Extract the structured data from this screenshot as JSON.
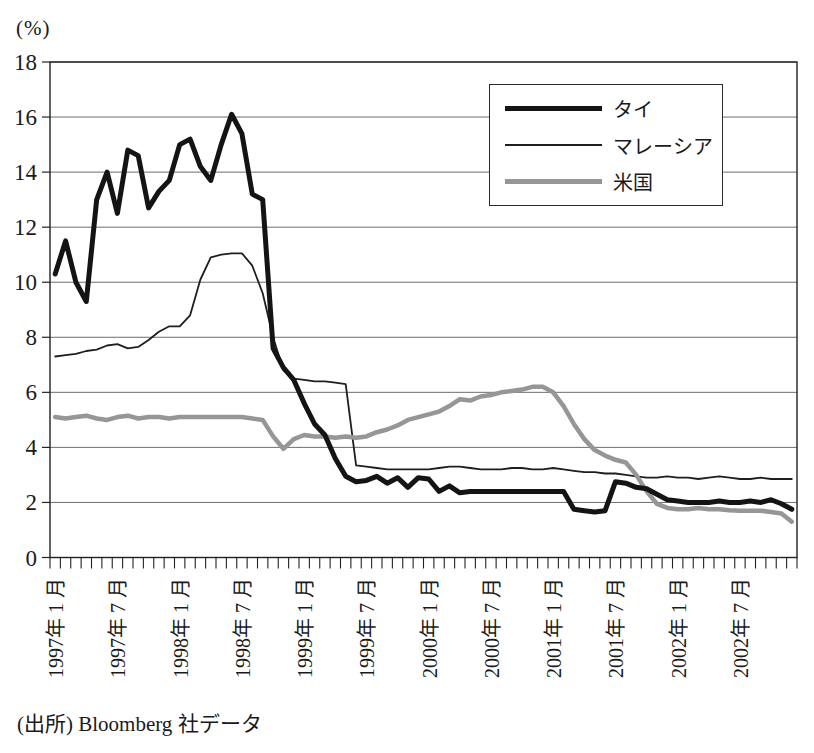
{
  "page": {
    "unit_label": "(%)",
    "source_note": "(出所) Bloomberg 社データ"
  },
  "chart_data": {
    "type": "line",
    "title": "",
    "ylabel": "(%)",
    "ylim": [
      0,
      18
    ],
    "y_ticks": [
      0,
      2,
      4,
      6,
      8,
      10,
      12,
      14,
      16,
      18
    ],
    "grid": "horizontal",
    "legend_position": "top-right",
    "x_start": "1997-01",
    "x_interval": "month",
    "x_tick_label_every_months": 6,
    "x_tick_labels": [
      "1997年 1 月",
      "1997年 7 月",
      "1998年 1 月",
      "1998年 7 月",
      "1999年 1 月",
      "1999年 7 月",
      "2000年 1 月",
      "2000年 7 月",
      "2001年 1 月",
      "2001年 7 月",
      "2002年 1 月",
      "2002年 7 月"
    ],
    "series": [
      {
        "name": "タイ",
        "color": "#141414",
        "width": 5,
        "values": [
          10.3,
          11.5,
          10.0,
          9.3,
          13.0,
          14.0,
          12.5,
          14.8,
          14.6,
          12.7,
          13.3,
          13.7,
          15.0,
          15.2,
          14.2,
          13.7,
          15.0,
          16.1,
          15.4,
          13.2,
          13.0,
          7.6,
          6.9,
          6.45,
          5.6,
          4.85,
          4.45,
          3.6,
          2.95,
          2.75,
          2.8,
          2.95,
          2.7,
          2.9,
          2.55,
          2.9,
          2.85,
          2.4,
          2.6,
          2.35,
          2.4,
          2.4,
          2.4,
          2.4,
          2.4,
          2.4,
          2.4,
          2.4,
          2.4,
          2.4,
          1.75,
          1.7,
          1.65,
          1.7,
          2.75,
          2.7,
          2.55,
          2.5,
          2.3,
          2.1,
          2.05,
          2.0,
          2.0,
          2.0,
          2.05,
          2.0,
          2.0,
          2.05,
          2.0,
          2.1,
          1.95,
          1.75
        ]
      },
      {
        "name": "マレーシア",
        "color": "#1e1e1e",
        "width": 1.8,
        "values": [
          7.3,
          7.35,
          7.4,
          7.5,
          7.55,
          7.7,
          7.75,
          7.6,
          7.65,
          7.9,
          8.2,
          8.4,
          8.4,
          8.8,
          10.1,
          10.9,
          11.0,
          11.05,
          11.05,
          10.6,
          9.6,
          8.0,
          6.8,
          6.5,
          6.45,
          6.4,
          6.4,
          6.35,
          6.3,
          3.35,
          3.3,
          3.25,
          3.2,
          3.2,
          3.2,
          3.2,
          3.2,
          3.25,
          3.3,
          3.3,
          3.25,
          3.2,
          3.2,
          3.2,
          3.25,
          3.25,
          3.2,
          3.2,
          3.25,
          3.2,
          3.15,
          3.1,
          3.1,
          3.05,
          3.05,
          3.0,
          2.95,
          2.9,
          2.9,
          2.95,
          2.9,
          2.9,
          2.85,
          2.9,
          2.95,
          2.9,
          2.85,
          2.85,
          2.9,
          2.85,
          2.85,
          2.85
        ]
      },
      {
        "name": "米国",
        "color": "#969696",
        "width": 4.5,
        "values": [
          5.1,
          5.05,
          5.1,
          5.15,
          5.05,
          5.0,
          5.1,
          5.15,
          5.05,
          5.1,
          5.1,
          5.05,
          5.1,
          5.1,
          5.1,
          5.1,
          5.1,
          5.1,
          5.1,
          5.05,
          5.0,
          4.4,
          3.95,
          4.3,
          4.45,
          4.4,
          4.4,
          4.35,
          4.4,
          4.35,
          4.4,
          4.55,
          4.65,
          4.8,
          5.0,
          5.1,
          5.2,
          5.3,
          5.5,
          5.75,
          5.7,
          5.85,
          5.9,
          6.0,
          6.05,
          6.1,
          6.2,
          6.2,
          6.0,
          5.5,
          4.85,
          4.3,
          3.9,
          3.7,
          3.55,
          3.45,
          3.0,
          2.4,
          1.95,
          1.8,
          1.75,
          1.75,
          1.8,
          1.75,
          1.75,
          1.72,
          1.7,
          1.7,
          1.7,
          1.65,
          1.6,
          1.3
        ]
      }
    ]
  }
}
